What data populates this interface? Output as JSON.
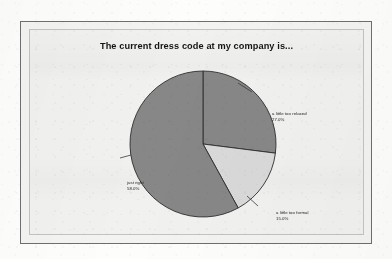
{
  "chart_data": {
    "type": "pie",
    "title": "The current dress code at my company is...",
    "categories": [
      "a little too relaxed",
      "a little too formal",
      "just right"
    ],
    "values": [
      27.0,
      15.0,
      58.0
    ],
    "value_labels": [
      "27.0%",
      "15.0%",
      "58.0%"
    ],
    "slice_colors": [
      "#878787",
      "#d9d9d9",
      "#878787"
    ],
    "start_angle_deg": 0,
    "direction": "clockwise",
    "legend": "none",
    "labels_position": "outside-with-leader-lines",
    "grid": false,
    "xlabel": "",
    "ylabel": ""
  },
  "chart": {
    "title": "The current dress code at my company is...",
    "slices": [
      {
        "name": "a little too relaxed",
        "percent_label": "27.0%",
        "value": 27.0,
        "color": "#878787"
      },
      {
        "name": "a little too formal",
        "percent_label": "15.0%",
        "value": 15.0,
        "color": "#d9d9d9"
      },
      {
        "name": "just right",
        "percent_label": "58.0%",
        "value": 58.0,
        "color": "#878787"
      }
    ]
  },
  "style": {
    "page_background": "#fdfdfc",
    "panel_background": "#f1f1ef",
    "frame_color": "#6e6e72",
    "inner_border_color": "#c3c3c0",
    "slice_outline": "#2c2c2c",
    "text_color": "#1b1b1b",
    "title_color": "#141414"
  }
}
